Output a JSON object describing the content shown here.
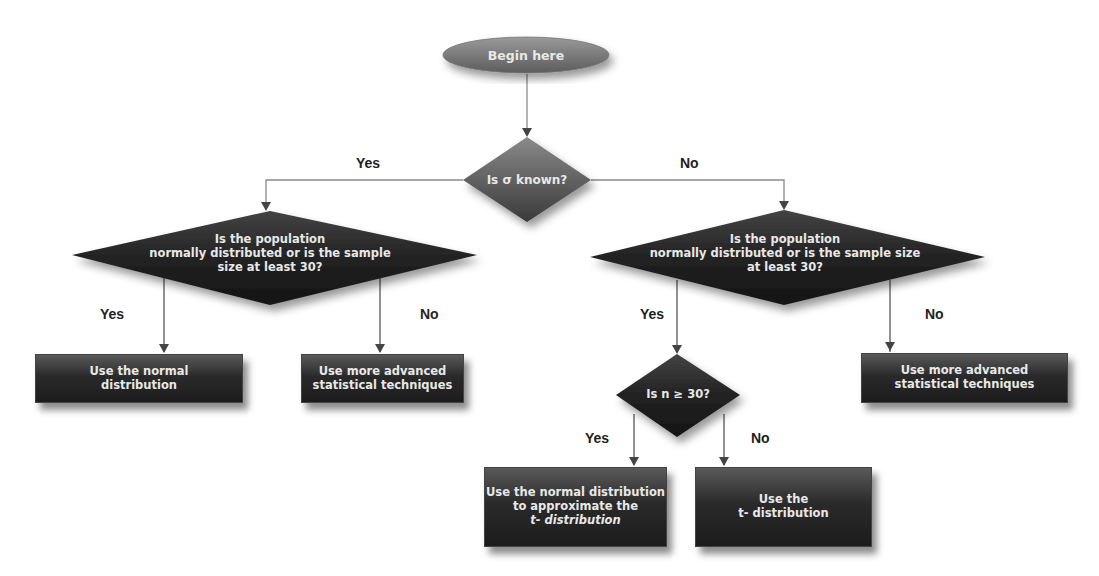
{
  "diagram": {
    "type": "flowchart",
    "start": {
      "id": "begin",
      "label": "Begin here"
    },
    "decisions": [
      {
        "id": "sigma_known",
        "label": "Is σ known?"
      },
      {
        "id": "normal_left",
        "lines": [
          "Is the population",
          "normally distributed or is the sample",
          "size at least 30?"
        ]
      },
      {
        "id": "normal_right",
        "lines": [
          "Is the population",
          "normally distributed or is the sample size",
          "at least 30?"
        ]
      },
      {
        "id": "n_ge_30",
        "label": "Is n ≥ 30?"
      }
    ],
    "outcomes": [
      {
        "id": "use_normal",
        "lines": [
          "Use the normal",
          "distribution"
        ]
      },
      {
        "id": "advanced_left",
        "lines": [
          "Use more advanced",
          "statistical techniques"
        ]
      },
      {
        "id": "advanced_right",
        "lines": [
          "Use more advanced",
          "statistical techniques"
        ]
      },
      {
        "id": "normal_approx_t",
        "lines": [
          "Use the normal distribution",
          "to approximate the",
          "t- distribution"
        ]
      },
      {
        "id": "use_t",
        "lines": [
          "Use the",
          "t- distribution"
        ]
      }
    ],
    "edge_labels": {
      "sigma_yes": "Yes",
      "sigma_no": "No",
      "left_yes": "Yes",
      "left_no": "No",
      "right_yes": "Yes",
      "right_no": "No",
      "n_yes": "Yes",
      "n_no": "No"
    },
    "edges": [
      {
        "from": "begin",
        "to": "sigma_known",
        "label": ""
      },
      {
        "from": "sigma_known",
        "to": "normal_left",
        "label": "Yes"
      },
      {
        "from": "sigma_known",
        "to": "normal_right",
        "label": "No"
      },
      {
        "from": "normal_left",
        "to": "use_normal",
        "label": "Yes"
      },
      {
        "from": "normal_left",
        "to": "advanced_left",
        "label": "No"
      },
      {
        "from": "normal_right",
        "to": "n_ge_30",
        "label": "Yes"
      },
      {
        "from": "normal_right",
        "to": "advanced_right",
        "label": "No"
      },
      {
        "from": "n_ge_30",
        "to": "normal_approx_t",
        "label": "Yes"
      },
      {
        "from": "n_ge_30",
        "to": "use_t",
        "label": "No"
      }
    ],
    "colors": {
      "node_fill_dark": "#2a2a2a",
      "node_fill_light": "#7a7a7a",
      "node_text": "#e8e8e8",
      "connector": "#8a8a8a",
      "label_text": "#222222"
    }
  }
}
